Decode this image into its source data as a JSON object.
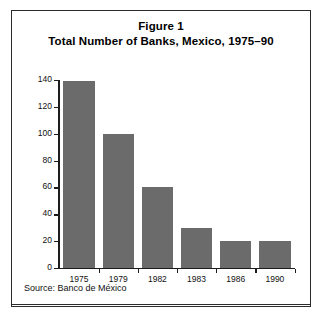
{
  "figure": {
    "title_line1": "Figure 1",
    "title_line2": "Total Number of Banks, Mexico, 1975–90",
    "source": "Source: Banco de México",
    "border_color": "#2b2b2b",
    "background_color": "#ffffff"
  },
  "chart_data": {
    "type": "bar",
    "subtitle": "Total Number of Banks, Mexico, 1975–90",
    "categories": [
      "1975",
      "1979",
      "1982",
      "1983",
      "1986",
      "1990"
    ],
    "values": [
      139,
      100,
      60,
      30,
      20,
      20
    ],
    "xlabel": "",
    "ylabel": "",
    "ylim": [
      0,
      140
    ],
    "yticks": [
      0,
      20,
      40,
      60,
      80,
      100,
      120,
      140
    ],
    "ytick_labels": [
      "0",
      "20",
      "40",
      "60",
      "80",
      "100",
      "120",
      "140"
    ],
    "grid": false,
    "legend": null,
    "bar_color": "#6b6b6b",
    "axis_color": "#1c1c1c",
    "source": "Source: Banco de México"
  }
}
